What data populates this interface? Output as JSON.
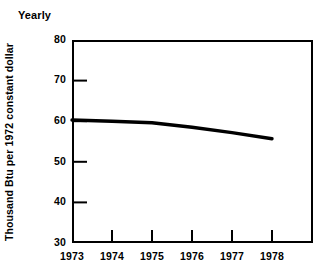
{
  "chart_data": {
    "type": "line",
    "title": "Yearly",
    "xlabel": "",
    "ylabel": "Thousand Btu per 1972 constant dollar",
    "x": [
      1973,
      1974,
      1975,
      1976,
      1977,
      1978
    ],
    "categories": [
      "1973",
      "1974",
      "1975",
      "1976",
      "1977",
      "1978"
    ],
    "series": [
      {
        "name": "Energy intensity",
        "values": [
          60.3,
          60.0,
          59.6,
          58.5,
          57.2,
          55.7
        ]
      }
    ],
    "ylim": [
      30,
      80
    ],
    "xlim": [
      1973,
      1978
    ],
    "ytick_labels": [
      "80",
      "70",
      "60",
      "50",
      "40",
      "30"
    ],
    "ytick_values": [
      80,
      70,
      60,
      50,
      40,
      30
    ],
    "xtick_labels": [
      "1973",
      "1974",
      "1975",
      "1976",
      "1977",
      "1978"
    ],
    "xtick_values": [
      1973,
      1974,
      1975,
      1976,
      1977,
      1978
    ],
    "grid": false,
    "legend": false,
    "legend_position": "none",
    "line_color": "#000000",
    "axis_color": "#000000",
    "background_color": "#ffffff",
    "annotations": []
  },
  "axes": {
    "y_ticks": [
      {
        "label": "80",
        "value": 80
      },
      {
        "label": "70",
        "value": 70
      },
      {
        "label": "60",
        "value": 60
      },
      {
        "label": "50",
        "value": 50
      },
      {
        "label": "40",
        "value": 40
      },
      {
        "label": "30",
        "value": 30
      }
    ],
    "x_ticks": [
      {
        "label": "1973",
        "value": 1973
      },
      {
        "label": "1974",
        "value": 1974
      },
      {
        "label": "1975",
        "value": 1975
      },
      {
        "label": "1976",
        "value": 1976
      },
      {
        "label": "1977",
        "value": 1977
      },
      {
        "label": "1978",
        "value": 1978
      }
    ]
  }
}
